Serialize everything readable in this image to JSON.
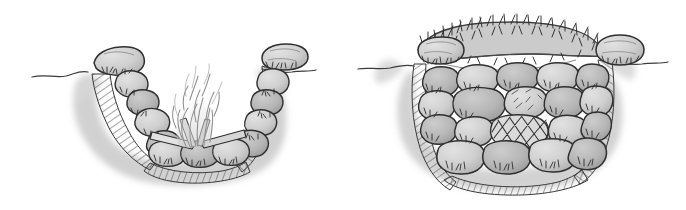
{
  "canvas": {
    "width": 686,
    "height": 210,
    "background_color": "#ffffff",
    "media": "pen-and-ink line drawing with gray wash",
    "title": "Two cross-section drawings of stone-lined cooking fire pits"
  },
  "palette": {
    "paper_white": "#ffffff",
    "ink_black": "#2b2b2b",
    "ink_dark": "#3a3a3a",
    "stone_fill_light": "#d8d8d8",
    "stone_fill_mid": "#c4c4c4",
    "stone_fill_dark": "#ababab",
    "soil_wash": "#cfcfcf",
    "soil_wash_soft": "#dedede",
    "shadow_wash": "#b9b9b9",
    "sod_fill": "#c9c9c9",
    "flame_line": "#9a9a9a",
    "hatch_line": "#5a5a5a"
  },
  "figures": [
    {
      "id": "left-figure",
      "name": "open-fire-pit",
      "label": "Stone-lined fire pit with fire burning",
      "bbox": [
        20,
        20,
        300,
        190
      ],
      "elements": [
        {
          "name": "ground-line",
          "label": "Ground surface line"
        },
        {
          "name": "soil-cross-section",
          "label": "Hatched soil cross-section walls"
        },
        {
          "name": "shadow-wash",
          "label": "Soft gray shadow wash around pit"
        },
        {
          "name": "rim-capstone-left",
          "label": "Large left rim capstone"
        },
        {
          "name": "rim-capstone-right",
          "label": "Large right rim capstone"
        },
        {
          "name": "stone-lining",
          "label": "Stacked stone lining of pit walls and floor"
        },
        {
          "name": "grass-tufts",
          "label": "Small grass tufts between stones"
        },
        {
          "name": "firewood-logs",
          "label": "Crossed firewood logs on pit floor"
        },
        {
          "name": "flames",
          "label": "Flames rising from the fire"
        }
      ],
      "stone_count": 16
    },
    {
      "id": "right-figure",
      "name": "covered-stone-pit",
      "label": "Stone-filled pit covered with sod and grass",
      "bbox": [
        360,
        10,
        670,
        195
      ],
      "elements": [
        {
          "name": "ground-line",
          "label": "Ground surface line"
        },
        {
          "name": "soil-cross-section",
          "label": "Hatched soil cross-section walls"
        },
        {
          "name": "shadow-wash",
          "label": "Soft gray shadow wash around pit"
        },
        {
          "name": "sod-cover",
          "label": "Curved sod and grass turf cover over the pit"
        },
        {
          "name": "grass-blades",
          "label": "Spiky grass blades on top of sod"
        },
        {
          "name": "rim-capstone-left",
          "label": "Large left rim capstone"
        },
        {
          "name": "rim-capstone-right",
          "label": "Large right rim capstone"
        },
        {
          "name": "stone-fill",
          "label": "Rounded stones filling the pit in stacked rows"
        },
        {
          "name": "crosshatched-stone",
          "label": "Center stone marked with X cross-hatching"
        },
        {
          "name": "grass-tufts",
          "label": "Small grass tufts between stones"
        }
      ],
      "stone_count": 24
    }
  ],
  "annotations": {
    "caption": "",
    "has_text": false
  }
}
